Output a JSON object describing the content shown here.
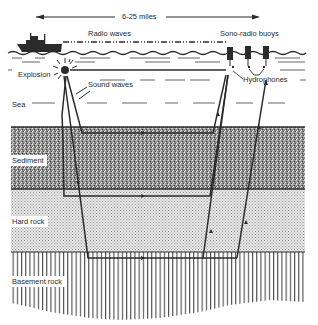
{
  "diagram": {
    "distance_label": "6-25 miles",
    "labels": {
      "radio_waves": "Radio waves",
      "sono_radio_buoys": "Sono-radio buoys",
      "explosion": "Explosion",
      "sound_waves": "Sound waves",
      "hydrophones": "Hydrophones",
      "sea": "Sea",
      "sediment": "Sediment",
      "hard_rock": "Hard rock",
      "basement_rock": "Basement rock"
    },
    "layers": [
      {
        "name": "Sea",
        "top": 52,
        "bottom": 127,
        "pattern": "dashes"
      },
      {
        "name": "Sediment",
        "top": 127,
        "bottom": 189,
        "pattern": "dense-speckle"
      },
      {
        "name": "Hard rock",
        "top": 189,
        "bottom": 252,
        "pattern": "fine-dots"
      },
      {
        "name": "Basement rock",
        "top": 252,
        "bottom": 320,
        "pattern": "vertical-lines"
      }
    ],
    "objects": {
      "ship": {
        "x": 15,
        "y": 38
      },
      "explosion": {
        "x": 65,
        "y": 70
      },
      "buoys": [
        {
          "x": 229
        },
        {
          "x": 248
        },
        {
          "x": 266
        }
      ]
    },
    "colors": {
      "ink": "#2b2b2b",
      "sediment": "#7a7a7a",
      "hard_rock": "#d9d9d9",
      "background": "#ffffff"
    }
  }
}
